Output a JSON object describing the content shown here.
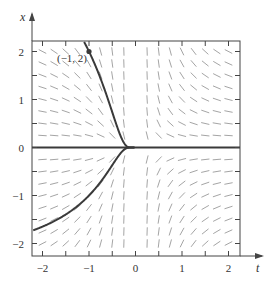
{
  "chart_data": {
    "type": "line",
    "subtype": "slope-field-with-solution-curves",
    "title": "",
    "xlabel": "t",
    "ylabel": "x",
    "xlim": [
      -2.2,
      2.25
    ],
    "ylim": [
      -2.25,
      2.2
    ],
    "xticks": [
      -2,
      -1.5,
      -1,
      -0.5,
      0,
      0.5,
      1,
      1.5,
      2
    ],
    "xtick_labels": [
      "-2",
      "",
      "-1",
      "",
      "0",
      "",
      "1",
      "",
      "2"
    ],
    "yticks": [
      -2,
      -1.5,
      -1,
      -0.5,
      0,
      0.5,
      1,
      1.5,
      2
    ],
    "ytick_labels": [
      "-2",
      "",
      "-1",
      "",
      "0",
      "",
      "1",
      "",
      "2"
    ],
    "tick_label_text": {
      "x": [
        "−2",
        "−1",
        "0",
        "1",
        "2"
      ],
      "y": [
        "−2",
        "−1",
        "0",
        "1",
        "2"
      ]
    },
    "grid": false,
    "legend": null,
    "slope_field": {
      "equation": "dx/dt = -x/t^2",
      "spacing": 0.25
    },
    "series": [
      {
        "name": "upper solution through (-1, 2)",
        "formula": "x = 2e^(1 + 1/t)",
        "x": [
          -1.13,
          -1.0,
          -0.8,
          -0.6,
          -0.5,
          -0.4,
          -0.3,
          -0.2
        ],
        "values": [
          2.2,
          2.0,
          1.59,
          1.03,
          0.74,
          0.45,
          0.19,
          0.02
        ]
      },
      {
        "name": "lower solution",
        "formula": "x = -e^(1 + 1/t)",
        "x": [
          -2.2,
          -2.0,
          -1.5,
          -1.0,
          -0.7,
          -0.5,
          -0.3,
          -0.2
        ],
        "values": [
          -1.72,
          -1.65,
          -1.4,
          -1.0,
          -0.65,
          -0.37,
          -0.1,
          -0.02
        ]
      },
      {
        "name": "equilibrium x = 0",
        "x": [
          -2.2,
          2.25
        ],
        "values": [
          0,
          0
        ]
      }
    ],
    "annotations": [
      {
        "text": "(−1, 2)",
        "t": -1,
        "x": 2,
        "marker": "dot"
      }
    ]
  },
  "labels": {
    "point": "(−1, 2)",
    "xaxis": "t",
    "yaxis": "x"
  },
  "colors": {
    "frame": "#444444",
    "curve": "#3a3a3a",
    "field": "#9a9a9a",
    "text": "#333333"
  }
}
